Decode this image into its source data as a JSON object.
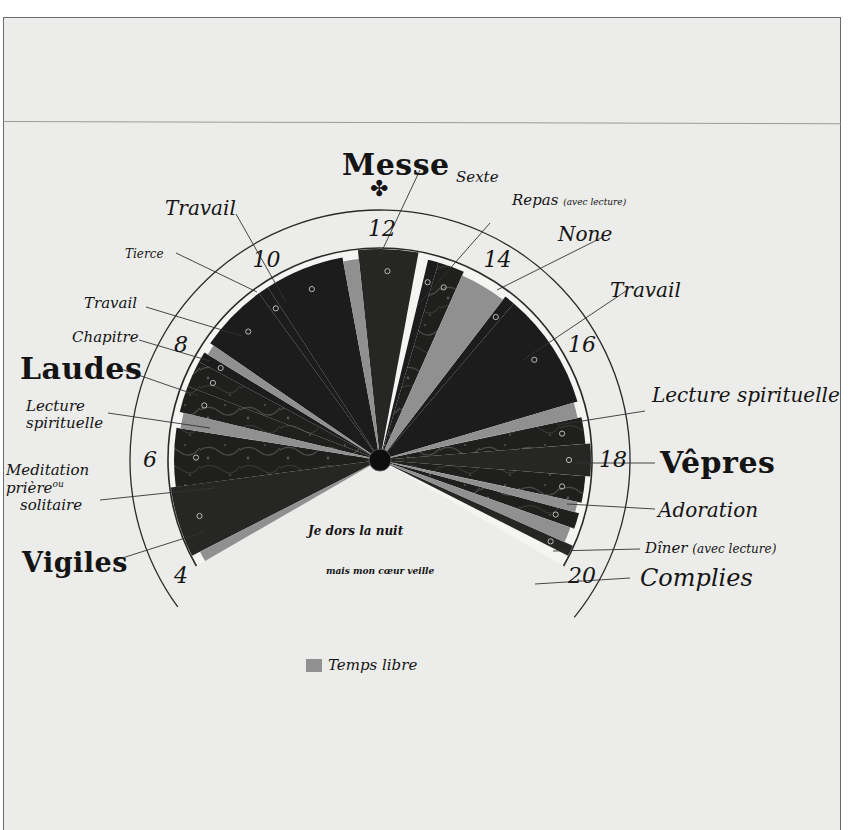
{
  "title": "Messe",
  "hour_labels": [
    {
      "value": "4",
      "hour": 4
    },
    {
      "value": "6",
      "hour": 6
    },
    {
      "value": "8",
      "hour": 8
    },
    {
      "value": "10",
      "hour": 10
    },
    {
      "value": "12",
      "hour": 12
    },
    {
      "value": "14",
      "hour": 14
    },
    {
      "value": "16",
      "hour": 16
    },
    {
      "value": "18",
      "hour": 18
    },
    {
      "value": "20",
      "hour": 20
    }
  ],
  "activities": [
    {
      "label": "Vigiles",
      "start": 4.2,
      "end": 5.5,
      "kind": "office"
    },
    {
      "label": "Meditation ou prière solitaire",
      "start": 5.5,
      "end": 6.6,
      "kind": "texture"
    },
    {
      "label": "Lecture spirituelle",
      "start": 6.9,
      "end": 7.4,
      "kind": "texture"
    },
    {
      "label": "Laudes",
      "start": 7.4,
      "end": 7.9,
      "kind": "texture"
    },
    {
      "label": "Chapitre",
      "start": 7.9,
      "end": 8.1,
      "kind": "dark"
    },
    {
      "label": "Travail",
      "start": 8.3,
      "end": 9.6,
      "kind": "dark"
    },
    {
      "label": "Tierce",
      "start": 9.6,
      "end": 9.8,
      "kind": "dark"
    },
    {
      "label": "Travail",
      "start": 9.8,
      "end": 11.3,
      "kind": "dark"
    },
    {
      "label": "Messe",
      "start": 11.6,
      "end": 12.7,
      "kind": "office"
    },
    {
      "label": "Sexte",
      "start": 12.9,
      "end": 13.1,
      "kind": "dark"
    },
    {
      "label": "Repas (avec lecture)",
      "start": 13.1,
      "end": 13.6,
      "kind": "texture"
    },
    {
      "label": "None",
      "start": 14.5,
      "end": 14.7,
      "kind": "dark"
    },
    {
      "label": "Travail",
      "start": 14.7,
      "end": 16.9,
      "kind": "dark"
    },
    {
      "label": "Lecture spirituelle",
      "start": 17.2,
      "end": 17.7,
      "kind": "texture"
    },
    {
      "label": "Vêpres",
      "start": 17.7,
      "end": 18.3,
      "kind": "office"
    },
    {
      "label": "Adoration",
      "start": 18.3,
      "end": 18.8,
      "kind": "texture"
    },
    {
      "label": "Dîner (avec lecture)",
      "start": 19.0,
      "end": 19.3,
      "kind": "texture"
    },
    {
      "label": "Complies",
      "start": 19.6,
      "end": 19.8,
      "kind": "office"
    }
  ],
  "free_time": [
    {
      "start": 4.0,
      "end": 4.2
    },
    {
      "start": 6.6,
      "end": 6.9
    },
    {
      "start": 8.1,
      "end": 8.3
    },
    {
      "start": 11.3,
      "end": 11.6
    },
    {
      "start": 13.6,
      "end": 14.5
    },
    {
      "start": 16.9,
      "end": 17.2
    },
    {
      "start": 18.8,
      "end": 19.0
    },
    {
      "start": 19.3,
      "end": 19.6
    }
  ],
  "callouts": {
    "messe": "Messe",
    "sexte": "Sexte",
    "repas": "Repas",
    "repas_note": "(avec lecture)",
    "none": "None",
    "travail_right": "Travail",
    "lecture_right": "Lecture spirituelle",
    "vepres": "Vêpres",
    "adoration": "Adoration",
    "diner": "Dîner",
    "diner_note": "(avec lecture)",
    "complies": "Complies",
    "travail_top": "Travail",
    "tierce": "Tierce",
    "travail_left": "Travail",
    "chapitre": "Chapitre",
    "laudes": "Laudes",
    "lecture_left_1": "Lecture",
    "lecture_left_2": "spirituelle",
    "meditation_1": "Meditation",
    "meditation_2": "prière",
    "meditation_ou": "ou",
    "meditation_3": "solitaire",
    "vigiles": "Vigiles"
  },
  "night_text": {
    "line1": "Je dors la nuit",
    "line2": "mais mon cœur veille"
  },
  "legend": {
    "label": "Temps libre",
    "color": "#909090"
  },
  "colors": {
    "paper": "#ececea",
    "ink": "#141414",
    "dark_wedge": "#1c1c1c",
    "texture_wedge": "#2a2a28",
    "free_time": "#909090",
    "ring": "#f4f4f2"
  }
}
